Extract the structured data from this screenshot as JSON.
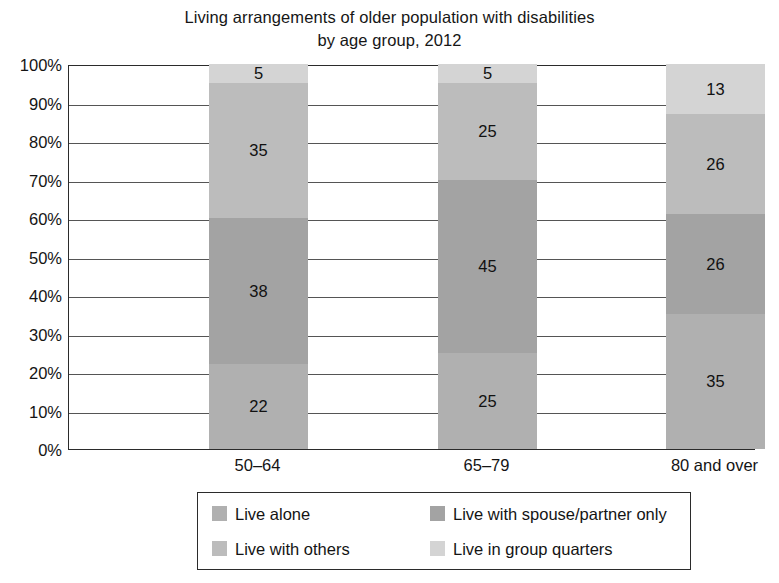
{
  "chart_data": {
    "type": "bar",
    "subtype": "100% stacked bar",
    "title": "Living arrangements of older population with disabilities by age group, 2012",
    "title_lines": [
      "Living arrangements of older population with disabilities",
      "by age group, 2012"
    ],
    "xlabel": "",
    "ylabel": "",
    "ylim": [
      0,
      100
    ],
    "grid": true,
    "legend_position": "bottom",
    "categories": [
      "50–64",
      "65–79",
      "80 and over"
    ],
    "ytick_labels": [
      "0%",
      "10%",
      "20%",
      "30%",
      "40%",
      "50%",
      "60%",
      "70%",
      "80%",
      "90%",
      "100%"
    ],
    "ytick_values": [
      0,
      10,
      20,
      30,
      40,
      50,
      60,
      70,
      80,
      90,
      100
    ],
    "series": [
      {
        "name": "Live alone",
        "color": "#b0b0b0",
        "values": [
          22,
          25,
          35
        ]
      },
      {
        "name": "Live with spouse/partner only",
        "color": "#a3a3a3",
        "values": [
          38,
          45,
          26
        ]
      },
      {
        "name": "Live with others",
        "color": "#bcbcbc",
        "values": [
          35,
          25,
          26
        ]
      },
      {
        "name": "Live in group quarters",
        "color": "#d4d4d4",
        "values": [
          5,
          5,
          13
        ]
      }
    ]
  },
  "legend": {
    "items": [
      {
        "label": "Live alone",
        "color": "#b0b0b0"
      },
      {
        "label": "Live with spouse/partner only",
        "color": "#a3a3a3"
      },
      {
        "label": "Live with others",
        "color": "#bcbcbc"
      },
      {
        "label": "Live in group quarters",
        "color": "#d4d4d4"
      }
    ]
  }
}
